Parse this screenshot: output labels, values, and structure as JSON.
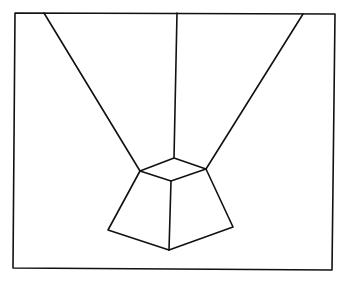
{
  "figure": {
    "stroke_color": "#111111",
    "background_color": "#ffffff"
  },
  "frame": {
    "points": [
      [
        15,
        13
      ],
      [
        335,
        14
      ],
      [
        332,
        270
      ],
      [
        13,
        268
      ]
    ]
  },
  "vertices": {
    "top_back": [
      174,
      158
    ],
    "top_left": [
      140,
      171
    ],
    "top_right": [
      206,
      169
    ],
    "top_front": [
      171,
      181
    ],
    "bottom_left": [
      108,
      230
    ],
    "bottom_front": [
      169,
      250
    ],
    "bottom_right": [
      233,
      227
    ]
  },
  "converging_lines": [
    {
      "name": "left-convergence-line",
      "from": [
        44,
        13
      ],
      "to": [
        140,
        171
      ]
    },
    {
      "name": "center-convergence-line",
      "from": [
        177,
        13
      ],
      "to": [
        174,
        158
      ]
    },
    {
      "name": "right-convergence-line",
      "from": [
        303,
        14
      ],
      "to": [
        206,
        169
      ]
    }
  ]
}
